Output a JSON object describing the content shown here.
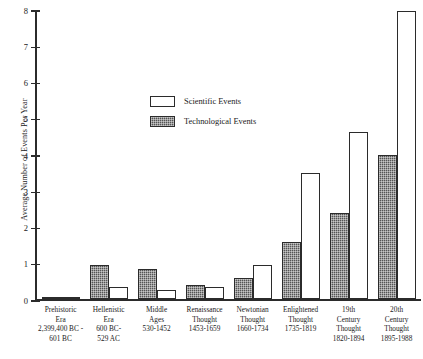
{
  "chart_data": {
    "type": "bar",
    "title": "",
    "xlabel": "",
    "ylabel": "Average Number of Events Per Year",
    "ylim": [
      0,
      8
    ],
    "yticks": [
      "0",
      "1",
      "2",
      "3",
      "4",
      "5",
      "6",
      "7",
      "8"
    ],
    "grid": false,
    "legend_position": "upper-center-left",
    "categories": [
      "Prehistoric Era 2,399,400 BC - 601 BC",
      "Hellenistic Era 600 BC-529 AC",
      "Middle Ages 530-1452",
      "Renaissance Thought 1453-1659",
      "Newtonian Thought 1660-1734",
      "Enlightened Thought 1735-1819",
      "19th Century Thought 1820-1894",
      "20th Century Thought 1895-1988"
    ],
    "category_lines": [
      [
        "Prehistoric",
        "Era",
        "2,399,400 BC -",
        "601 BC"
      ],
      [
        "Hellenistic",
        "Era",
        "600 BC-",
        "529 AC"
      ],
      [
        "Middle",
        "Ages",
        "530-1452"
      ],
      [
        "Renaissance",
        "Thought",
        "1453-1659"
      ],
      [
        "Newtonian",
        "Thought",
        "1660-1734"
      ],
      [
        "Enlightened",
        "Thought",
        "1735-1819"
      ],
      [
        "19th",
        "Century",
        "Thought",
        "1820-1894"
      ],
      [
        "20th",
        "Century",
        "Thought",
        "1895-1988"
      ]
    ],
    "series": [
      {
        "name": "Technological Events",
        "key": "tech",
        "color": "#555555",
        "values": [
          0.03,
          0.95,
          0.85,
          0.4,
          0.6,
          1.6,
          2.4,
          4.0
        ]
      },
      {
        "name": "Scientific Events",
        "key": "sci",
        "color": "#ffffff",
        "values": [
          0.02,
          0.35,
          0.25,
          0.35,
          0.95,
          3.5,
          4.65,
          8.0
        ]
      }
    ]
  },
  "legend": {
    "items": [
      {
        "label": "Scientific Events",
        "key": "sci"
      },
      {
        "label": "Technological Events",
        "key": "tech"
      }
    ]
  }
}
